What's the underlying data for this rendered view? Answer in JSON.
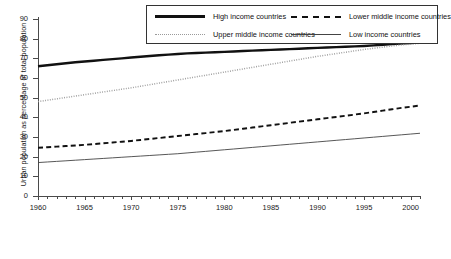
{
  "chart_data": {
    "type": "line",
    "title": "",
    "xlabel": "",
    "ylabel": "Urban population as percentage of total population",
    "xlim": [
      1960,
      2001
    ],
    "ylim": [
      0,
      90
    ],
    "grid": false,
    "legend_position": "top-right-inside-box",
    "ytick_labels": [
      "0",
      "10",
      "20",
      "30",
      "40",
      "50",
      "60",
      "70",
      "80",
      "90"
    ],
    "ytick_values": [
      0,
      10,
      20,
      30,
      40,
      50,
      60,
      70,
      80,
      90
    ],
    "xtick_labels": [
      "1960",
      "1965",
      "1970",
      "1975",
      "1980",
      "1985",
      "1990",
      "1995",
      "2000"
    ],
    "xtick_values": [
      1960,
      1965,
      1970,
      1975,
      1980,
      1985,
      1990,
      1995,
      2000
    ],
    "x": [
      1960,
      1961,
      1962,
      1963,
      1964,
      1965,
      1966,
      1967,
      1968,
      1969,
      1970,
      1971,
      1972,
      1973,
      1974,
      1975,
      1976,
      1977,
      1978,
      1979,
      1980,
      1981,
      1982,
      1983,
      1984,
      1985,
      1986,
      1987,
      1988,
      1989,
      1990,
      1991,
      1992,
      1993,
      1994,
      1995,
      1996,
      1997,
      1998,
      1999,
      2000,
      2001
    ],
    "series": [
      {
        "name": "High income countries",
        "style": "solid-bold",
        "color": "#111111",
        "values": [
          66.0,
          66.5,
          67.0,
          67.5,
          68.0,
          68.4,
          68.8,
          69.2,
          69.6,
          70.0,
          70.4,
          70.8,
          71.2,
          71.6,
          71.9,
          72.2,
          72.5,
          72.7,
          72.9,
          73.1,
          73.3,
          73.5,
          73.7,
          73.9,
          74.1,
          74.3,
          74.5,
          74.7,
          74.9,
          75.1,
          75.3,
          75.5,
          75.7,
          75.9,
          76.1,
          76.3,
          76.6,
          76.9,
          77.2,
          77.5,
          77.8,
          78.1
        ]
      },
      {
        "name": "Upper middle income countries",
        "style": "dotted",
        "color": "#9a9a9a",
        "values": [
          48.0,
          48.7,
          49.4,
          50.1,
          50.8,
          51.5,
          52.2,
          52.9,
          53.6,
          54.3,
          55.0,
          55.8,
          56.6,
          57.4,
          58.2,
          59.0,
          59.8,
          60.6,
          61.4,
          62.2,
          63.0,
          63.8,
          64.6,
          65.4,
          66.2,
          67.0,
          67.8,
          68.6,
          69.4,
          70.2,
          71.0,
          71.7,
          72.4,
          73.1,
          73.8,
          74.5,
          75.1,
          75.7,
          76.3,
          76.8,
          77.2,
          77.6
        ]
      },
      {
        "name": "Lower middle income countries",
        "style": "dashed",
        "color": "#111111",
        "values": [
          24.5,
          24.8,
          25.1,
          25.4,
          25.7,
          26.0,
          26.4,
          26.8,
          27.2,
          27.6,
          28.0,
          28.5,
          29.0,
          29.5,
          30.0,
          30.5,
          31.0,
          31.5,
          32.0,
          32.5,
          33.0,
          33.6,
          34.2,
          34.8,
          35.4,
          36.0,
          36.6,
          37.2,
          37.8,
          38.4,
          39.0,
          39.6,
          40.2,
          40.8,
          41.4,
          42.0,
          42.7,
          43.4,
          44.1,
          44.8,
          45.4,
          46.0
        ]
      },
      {
        "name": "Low income countries",
        "style": "thin-solid",
        "color": "#444444",
        "values": [
          17.0,
          17.3,
          17.6,
          17.9,
          18.2,
          18.5,
          18.8,
          19.1,
          19.4,
          19.7,
          20.0,
          20.3,
          20.6,
          20.9,
          21.2,
          21.5,
          21.9,
          22.3,
          22.7,
          23.1,
          23.5,
          23.9,
          24.3,
          24.7,
          25.1,
          25.5,
          25.9,
          26.3,
          26.7,
          27.1,
          27.5,
          27.9,
          28.3,
          28.7,
          29.1,
          29.5,
          29.9,
          30.3,
          30.7,
          31.1,
          31.5,
          31.9
        ]
      }
    ]
  },
  "legend": {
    "entries": [
      {
        "label": "High income countries",
        "style": "solid-bold"
      },
      {
        "label": "Lower middle income countries",
        "style": "dashed"
      },
      {
        "label": "Upper middle income countries",
        "style": "dotted"
      },
      {
        "label": "Low income countries",
        "style": "thin-solid"
      }
    ]
  }
}
